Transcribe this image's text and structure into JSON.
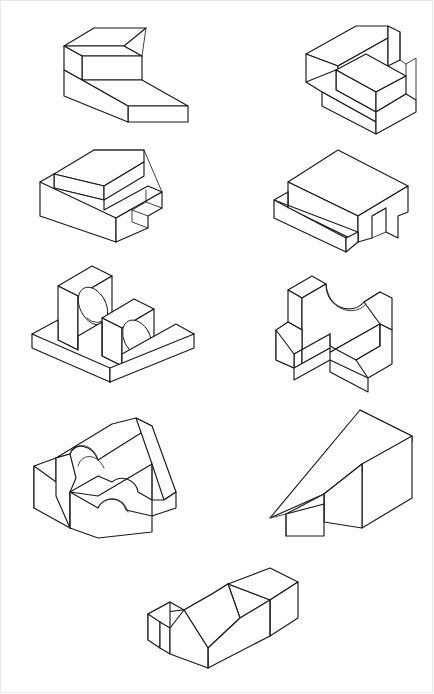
{
  "sheet": {
    "title": "Isometric Pictorial Views — Machine Parts Sheet",
    "background_color": "#ffffff",
    "line_color": "#1a1a1a",
    "border_color": "#e8e8e8",
    "width": 434,
    "height": 694,
    "projection": "isometric",
    "layout": "4 rows of 2 figures plus 1 centered figure at the bottom",
    "figure_count": 9
  },
  "figures": [
    {
      "id": "figure-1",
      "position": "row-1-left",
      "name": "Stepped block with chamfered top rear edge",
      "features": "Two-level step, vertical left end wall, chamfer across upper rear top edge"
    },
    {
      "id": "figure-2",
      "position": "row-1-right",
      "name": "U-shaped block with raised central boss",
      "features": "Tall rear wall, rectangular central raised pad, open slot at right side"
    },
    {
      "id": "figure-3",
      "position": "row-2-left",
      "name": "Long base with top rib and end notch",
      "features": "Rectangular base, full-length raised rib, square notch cut at right end"
    },
    {
      "id": "figure-4",
      "position": "row-2-right",
      "name": "Block with front ledge and right-side slot",
      "features": "Solid upper box, projecting front ledge, vertical through slot on right face"
    },
    {
      "id": "figure-5",
      "position": "row-3-left",
      "name": "Bearing support with two drilled lugs",
      "features": "Flat base plate, two upright plates each with a through hole"
    },
    {
      "id": "figure-6",
      "position": "row-3-right",
      "name": "Bracket with semicircular top cut and front slot",
      "features": "Upright wall with concave semicircular cutout, horizontal arm with rectangular slot"
    },
    {
      "id": "figure-7",
      "position": "row-4-left",
      "name": "Angle block with fillets and semicircular notches",
      "features": "Inclined side webs, rounded notch in top face, semicircular cutout in front face"
    },
    {
      "id": "figure-8",
      "position": "row-4-right",
      "name": "Wedge block with stepped front",
      "features": "Large inclined top face, two-level step on the front-left side"
    },
    {
      "id": "figure-9",
      "position": "row-5-center",
      "name": "Block with angled top face and end notch",
      "features": "Long rectangular body, sloped corner facet on top, rectangular notch at left end"
    }
  ]
}
